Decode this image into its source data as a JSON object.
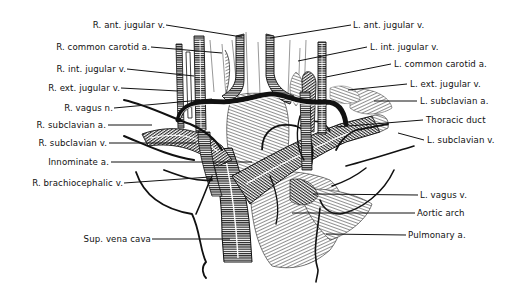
{
  "figure": {
    "type": "anatomical illustration",
    "colors": {
      "ink": "#111111",
      "background": "#ffffff",
      "hatch": "#222222"
    }
  },
  "labels": {
    "left": [
      {
        "id": "r-ant-jugular-v",
        "text": "R. ant. jugular v."
      },
      {
        "id": "r-common-carotid-a",
        "text": "R. common carotid a."
      },
      {
        "id": "r-int-jugular-v",
        "text": "R. int. jugular v."
      },
      {
        "id": "r-ext-jugular-v",
        "text": "R. ext. jugular v."
      },
      {
        "id": "r-vagus-n",
        "text": "R. vagus n."
      },
      {
        "id": "r-subclavian-a",
        "text": "R. subclavian a."
      },
      {
        "id": "r-subclavian-v",
        "text": "R. subclavian v."
      },
      {
        "id": "innominate-a",
        "text": "Innominate a."
      },
      {
        "id": "r-brachiocephalic-v",
        "text": "R. brachiocephalic v."
      },
      {
        "id": "sup-vena-cava",
        "text": "Sup. vena cava"
      }
    ],
    "right": [
      {
        "id": "l-ant-jugular-v",
        "text": "L. ant. jugular v."
      },
      {
        "id": "l-int-jugular-v",
        "text": "L. int. jugular v."
      },
      {
        "id": "l-common-carotid-a",
        "text": "L. common carotid a."
      },
      {
        "id": "l-ext-jugular-v",
        "text": "L. ext. jugular v."
      },
      {
        "id": "l-subclavian-a",
        "text": "L. subclavian a."
      },
      {
        "id": "thoracic-duct",
        "text": "Thoracic duct"
      },
      {
        "id": "l-subclavian-v",
        "text": "L. subclavian v."
      },
      {
        "id": "l-vagus-v",
        "text": "L. vagus v."
      },
      {
        "id": "aortic-arch",
        "text": "Aortic arch"
      },
      {
        "id": "pulmonary-a",
        "text": "Pulmonary a."
      }
    ]
  }
}
